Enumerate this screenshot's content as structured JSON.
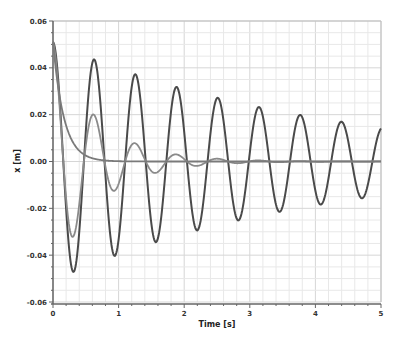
{
  "chart_data": {
    "type": "line",
    "title": "",
    "xlabel": "Time [s]",
    "ylabel": "x [m]",
    "xlim": [
      0,
      5
    ],
    "ylim": [
      -0.06,
      0.06
    ],
    "x_ticks": [
      0,
      1,
      2,
      3,
      4,
      5
    ],
    "x_tick_labels": [
      "0",
      "1",
      "2",
      "3",
      "4",
      "5"
    ],
    "y_ticks": [
      -0.06,
      -0.04,
      -0.02,
      0.0,
      0.02,
      0.04,
      0.06
    ],
    "y_tick_labels": [
      "-0.06",
      "-0.04",
      "-0.02",
      "0.00",
      "0.02",
      "0.04",
      "0.06"
    ],
    "grid": true,
    "legend": null,
    "series": [
      {
        "name": "lightly damped",
        "color": "#4a4a4a",
        "model": {
          "amplitude": 0.051,
          "decay": 0.25,
          "omega": 10.0
        },
        "peaks": [
          {
            "t": 0.0,
            "x": 0.051
          },
          {
            "t": 0.31,
            "x": -0.047
          },
          {
            "t": 0.63,
            "x": 0.044
          },
          {
            "t": 0.94,
            "x": -0.04
          },
          {
            "t": 1.26,
            "x": 0.037
          },
          {
            "t": 1.57,
            "x": -0.034
          },
          {
            "t": 1.89,
            "x": 0.032
          },
          {
            "t": 2.2,
            "x": -0.029
          },
          {
            "t": 2.52,
            "x": 0.027
          },
          {
            "t": 2.83,
            "x": -0.025
          },
          {
            "t": 3.14,
            "x": 0.023
          },
          {
            "t": 3.46,
            "x": -0.021
          },
          {
            "t": 3.77,
            "x": 0.02
          },
          {
            "t": 4.09,
            "x": -0.018
          },
          {
            "t": 4.4,
            "x": 0.017
          },
          {
            "t": 4.72,
            "x": -0.016
          },
          {
            "t": 5.0,
            "x": 0.013
          }
        ]
      },
      {
        "name": "moderately damped",
        "color": "#8a8a8a",
        "model": {
          "amplitude": 0.051,
          "decay": 1.5,
          "omega": 10.0
        },
        "peaks": [
          {
            "t": 0.0,
            "x": 0.051
          },
          {
            "t": 0.31,
            "x": -0.032
          },
          {
            "t": 0.63,
            "x": 0.02
          },
          {
            "t": 0.95,
            "x": -0.012
          },
          {
            "t": 1.26,
            "x": 0.0075
          },
          {
            "t": 1.57,
            "x": -0.005
          },
          {
            "t": 1.9,
            "x": 0.003
          },
          {
            "t": 2.2,
            "x": -0.002
          },
          {
            "t": 2.52,
            "x": 0.001
          },
          {
            "t": 5.0,
            "x": 0.0
          }
        ]
      },
      {
        "name": "overdamped",
        "color": "#7a7a7a",
        "model": {
          "amplitude": 0.051,
          "decay": 6.0,
          "omega": 0
        },
        "peaks": [
          {
            "t": 0.0,
            "x": 0.051
          },
          {
            "t": 0.2,
            "x": 0.026
          },
          {
            "t": 0.4,
            "x": 0.009
          },
          {
            "t": 0.6,
            "x": 0.003
          },
          {
            "t": 0.8,
            "x": 0.001
          },
          {
            "t": 1.0,
            "x": 0.0
          },
          {
            "t": 5.0,
            "x": 0.0
          }
        ]
      }
    ]
  },
  "layout_px": {
    "plot_left": 53,
    "plot_right": 381,
    "plot_top": 21,
    "plot_bottom": 302
  }
}
